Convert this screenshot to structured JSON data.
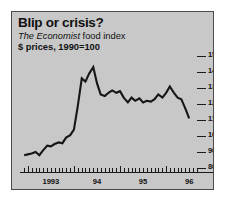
{
  "header": {
    "title": "Blip or crisis?",
    "subtitle_emphasis": "The Economist",
    "subtitle_rest": " food index",
    "subtitle_line2": "$ prices, 1990=100"
  },
  "colors": {
    "panel_background": "#c8c8c8",
    "page_background": "#ffffff",
    "line": "#161616",
    "axis": "#1a1a1a",
    "text": "#111111"
  },
  "chart_data": {
    "type": "line",
    "title": "Blip or crisis?",
    "subtitle": "The Economist food index",
    "ylabel": "$ prices, 1990=100",
    "xlabel": "",
    "ylim": [
      80,
      150
    ],
    "yticks": [
      150,
      140,
      130,
      120,
      110,
      100,
      90,
      80
    ],
    "ytick_labels": [
      "150",
      "140",
      "130",
      "120",
      "110",
      "100",
      "90",
      "80"
    ],
    "xlim": [
      1992.83,
      1996.67
    ],
    "xticks": [
      1993,
      1994,
      1995,
      1996
    ],
    "xtick_labels": [
      "1993",
      "94",
      "95",
      "96"
    ],
    "grid": false,
    "legend": false,
    "series": [
      {
        "name": "The Economist food index",
        "x": [
          1992.92,
          1993.0,
          1993.08,
          1993.17,
          1993.25,
          1993.33,
          1993.42,
          1993.5,
          1993.58,
          1993.67,
          1993.75,
          1993.83,
          1993.92,
          1994.0,
          1994.08,
          1994.17,
          1994.25,
          1994.33,
          1994.42,
          1994.5,
          1994.58,
          1994.67,
          1994.75,
          1994.83,
          1994.92,
          1995.0,
          1995.08,
          1995.17,
          1995.25,
          1995.33,
          1995.42,
          1995.5,
          1995.58,
          1995.67,
          1995.75,
          1995.83,
          1995.92,
          1996.0,
          1996.08,
          1996.17,
          1996.25,
          1996.33,
          1996.42,
          1996.5
        ],
        "values": [
          88,
          88.5,
          89,
          90,
          88,
          91,
          94,
          93.5,
          95,
          96,
          95.5,
          99,
          100.5,
          104,
          118,
          136,
          134,
          139,
          143,
          133,
          126,
          125,
          127,
          128.5,
          127,
          128,
          124,
          121,
          124,
          122,
          123.5,
          121,
          122,
          121.5,
          123,
          126,
          124,
          127,
          131,
          127,
          124,
          123,
          117,
          111
        ]
      }
    ],
    "annotations": [
      {
        "text": "peak",
        "x": 1994.42,
        "y": 143
      },
      {
        "text": "end",
        "x": 1996.5,
        "y": 111
      }
    ]
  }
}
